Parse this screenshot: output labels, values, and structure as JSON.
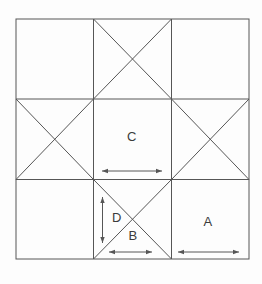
{
  "figure": {
    "canvas": {
      "width": 262,
      "height": 284
    },
    "colors": {
      "background": "#fdfdfd",
      "line": "#565656",
      "text": "#3b3b3b"
    },
    "border": {
      "x": 16,
      "y": 19,
      "width": 233,
      "height": 240
    },
    "lines": [
      {
        "name": "grid-vertical-line-1",
        "x1": 93.5,
        "y1": 19,
        "x2": 93.5,
        "y2": 259
      },
      {
        "name": "grid-vertical-line-2",
        "x1": 171.5,
        "y1": 19,
        "x2": 171.5,
        "y2": 259
      },
      {
        "name": "grid-horizontal-line-1",
        "x1": 16,
        "y1": 99,
        "x2": 249,
        "y2": 99
      },
      {
        "name": "grid-horizontal-line-2",
        "x1": 16,
        "y1": 179.5,
        "x2": 249,
        "y2": 179.5
      },
      {
        "name": "diagonal-top-middle-1",
        "x1": 93.5,
        "y1": 19,
        "x2": 171.5,
        "y2": 99
      },
      {
        "name": "diagonal-top-middle-2",
        "x1": 171.5,
        "y1": 19,
        "x2": 93.5,
        "y2": 99
      },
      {
        "name": "diagonal-middle-left-1",
        "x1": 16,
        "y1": 99,
        "x2": 93.5,
        "y2": 179.5
      },
      {
        "name": "diagonal-middle-left-2",
        "x1": 93.5,
        "y1": 99,
        "x2": 16,
        "y2": 179.5
      },
      {
        "name": "diagonal-middle-right-1",
        "x1": 171.5,
        "y1": 99,
        "x2": 249,
        "y2": 179.5
      },
      {
        "name": "diagonal-middle-right-2",
        "x1": 249,
        "y1": 99,
        "x2": 171.5,
        "y2": 179.5
      },
      {
        "name": "diagonal-bottom-middle-1",
        "x1": 93.5,
        "y1": 179.5,
        "x2": 171.5,
        "y2": 259
      },
      {
        "name": "diagonal-bottom-middle-2",
        "x1": 171.5,
        "y1": 179.5,
        "x2": 93.5,
        "y2": 259
      }
    ],
    "labels": [
      {
        "name": "label-C",
        "text": "C",
        "x": 132,
        "y": 141
      },
      {
        "name": "label-D",
        "text": "D",
        "x": 117,
        "y": 222
      },
      {
        "name": "label-B",
        "text": "B",
        "x": 133,
        "y": 240
      },
      {
        "name": "label-A",
        "text": "A",
        "x": 208,
        "y": 226
      }
    ],
    "arrows": [
      {
        "name": "dimension-arrow-C",
        "x1": 102,
        "y1": 171,
        "x2": 162,
        "y2": 171
      },
      {
        "name": "dimension-arrow-D",
        "x1": 102.5,
        "y1": 197,
        "x2": 102.5,
        "y2": 243
      },
      {
        "name": "dimension-arrow-B",
        "x1": 109,
        "y1": 252,
        "x2": 152,
        "y2": 252
      },
      {
        "name": "dimension-arrow-A",
        "x1": 178,
        "y1": 252,
        "x2": 239,
        "y2": 252
      }
    ]
  }
}
